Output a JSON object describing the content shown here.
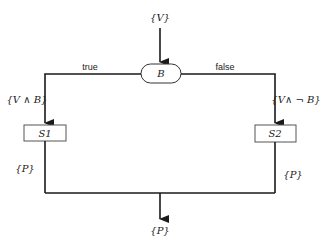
{
  "diagram": {
    "type": "flowchart",
    "precondition_label": "{V}",
    "decision": {
      "label": "B",
      "shape": "rounded-terminal"
    },
    "branches": [
      {
        "edge_label": "true",
        "assertion": "{V ∧ B}",
        "statement": "S1",
        "post_assertion": "{P}"
      },
      {
        "edge_label": "false",
        "assertion": "{V∧ ¬ B}",
        "statement": "S2",
        "post_assertion": "{P}"
      }
    ],
    "postcondition_label": "{P}"
  }
}
